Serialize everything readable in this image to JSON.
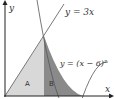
{
  "diagram": {
    "axes": {
      "x_label": "x",
      "y_label": "y"
    },
    "curves": [
      {
        "id": "line",
        "label": "y = 3x"
      },
      {
        "id": "parabola",
        "label": "y = (x − 6)²"
      }
    ],
    "regions": [
      {
        "id": "A",
        "label": "A",
        "color": "#d8d8d8"
      },
      {
        "id": "B",
        "label": "B",
        "color": "#8a8a8a"
      }
    ],
    "intersection": {
      "x": 3,
      "y": 9
    },
    "parabola_vertex": {
      "x": 6,
      "y": 0
    }
  }
}
